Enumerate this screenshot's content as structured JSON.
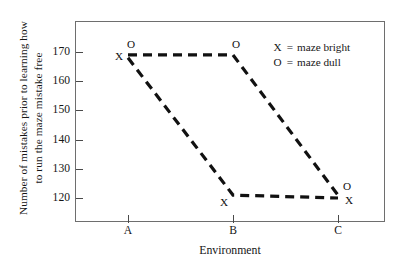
{
  "chart_data": {
    "type": "line",
    "title": "",
    "xlabel": "Environment",
    "ylabel": "Number of mistakes prior to learning how to run the maze mistake free",
    "ylabel_lines": [
      "Number of mistakes prior to learning how",
      "to run the maze mistake free"
    ],
    "categories": [
      "A",
      "B",
      "C"
    ],
    "xtick_labels": [
      "A",
      "B",
      "C"
    ],
    "ytick_labels": [
      "120",
      "130",
      "140",
      "150",
      "160",
      "170"
    ],
    "yticks": [
      120,
      130,
      140,
      150,
      160,
      170
    ],
    "ylim": [
      113,
      178
    ],
    "grid": false,
    "legend_position": "top-right",
    "series": [
      {
        "name": "maze dull",
        "symbol": "O",
        "values": [
          169,
          169,
          121
        ],
        "point_labels": [
          "O",
          "O",
          "O"
        ],
        "linestyle": "dashed",
        "color": "#111111"
      },
      {
        "name": "maze bright",
        "symbol": "X",
        "values": [
          168,
          121,
          120
        ],
        "point_labels": [
          "X",
          "X",
          "X"
        ],
        "linestyle": "dashed",
        "color": "#111111"
      }
    ],
    "legend": [
      {
        "symbol": "X",
        "equals": "=",
        "label": "maze bright"
      },
      {
        "symbol": "O",
        "equals": "=",
        "label": "maze dull"
      }
    ],
    "annotations": [
      {
        "text": "O",
        "category": "A",
        "value": 169,
        "placement": "above"
      },
      {
        "text": "X",
        "category": "A",
        "value": 168,
        "placement": "left"
      },
      {
        "text": "O",
        "category": "B",
        "value": 169,
        "placement": "above"
      },
      {
        "text": "X",
        "category": "B",
        "value": 121,
        "placement": "below-left"
      },
      {
        "text": "O",
        "category": "C",
        "value": 121,
        "placement": "right-above"
      },
      {
        "text": "X",
        "category": "C",
        "value": 120,
        "placement": "right-below"
      }
    ],
    "colors": {
      "line": "#111111",
      "frame": "#6e6e6e",
      "text": "#161616",
      "background": "#ffffff"
    }
  }
}
